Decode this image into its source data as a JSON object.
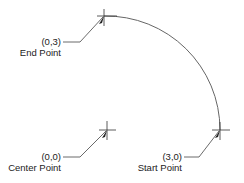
{
  "diagram": {
    "type": "arc-definition",
    "stroke_color": "#555555",
    "points": [
      {
        "id": "end",
        "coord": "(0,3)",
        "label": "End Point"
      },
      {
        "id": "center",
        "coord": "(0,0)",
        "label": "Center Point"
      },
      {
        "id": "start",
        "coord": "(3,0)",
        "label": "Start Point"
      }
    ]
  }
}
